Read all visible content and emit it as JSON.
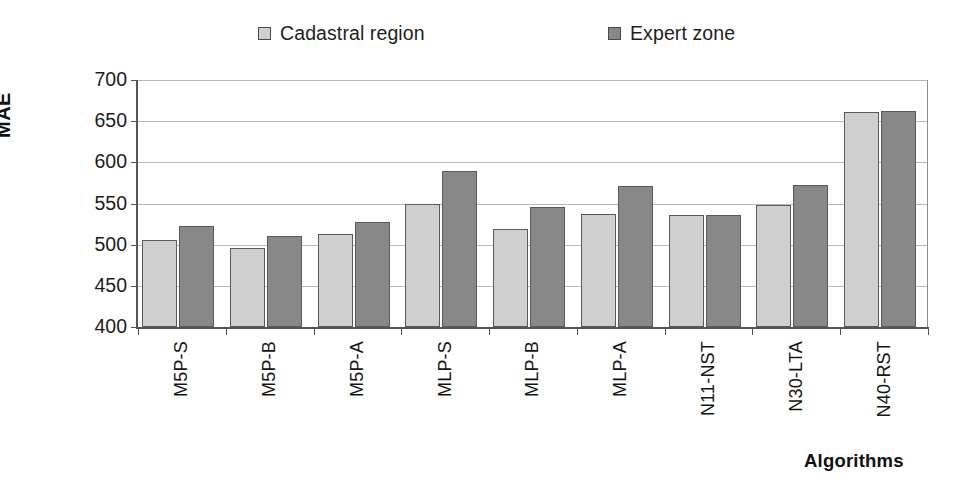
{
  "chart_data": {
    "type": "bar",
    "title": "",
    "xlabel": "Algorithms",
    "ylabel": "MAE",
    "ylim": [
      400,
      700
    ],
    "yticks": [
      400,
      450,
      500,
      550,
      600,
      650,
      700
    ],
    "grid": true,
    "legend_position": "top",
    "categories": [
      "M5P-S",
      "M5P-B",
      "M5P-A",
      "MLP-S",
      "MLP-B",
      "MLP-A",
      "N11-NST",
      "N30-LTA",
      "N40-RST"
    ],
    "series": [
      {
        "name": "Cadastral region",
        "color": "#cfcfcf",
        "values": [
          506,
          496,
          513,
          549,
          519,
          537,
          536,
          548,
          661
        ]
      },
      {
        "name": "Expert zone",
        "color": "#888888",
        "values": [
          523,
          510,
          527,
          589,
          546,
          571,
          536,
          572,
          662
        ]
      }
    ]
  },
  "legend": {
    "items": [
      {
        "label": "Cadastral region",
        "swatch": "#cfcfcf"
      },
      {
        "label": "Expert zone",
        "swatch": "#888888"
      }
    ]
  },
  "axes": {
    "y_title": "MAE",
    "x_title": "Algorithms"
  }
}
